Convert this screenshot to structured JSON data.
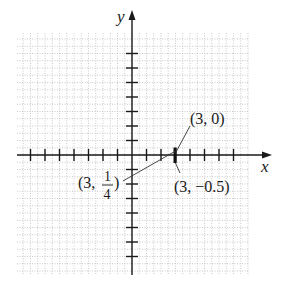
{
  "chart_data": {
    "type": "scatter",
    "title": "",
    "xlabel": "x",
    "ylabel": "y",
    "grid": true,
    "grid_style": "dotted",
    "xlim": [
      -7.5,
      8.5
    ],
    "ylim": [
      -8,
      8.5
    ],
    "x_ticks": [
      -7,
      -6,
      -5,
      -4,
      -3,
      -2,
      -1,
      1,
      2,
      3,
      4,
      5,
      6,
      7
    ],
    "y_ticks": [
      -7,
      -6,
      -5,
      -4,
      -3,
      -2,
      -1,
      1,
      2,
      3,
      4,
      5,
      6,
      7
    ],
    "tick_labels_shown": false,
    "highlighted_segment": {
      "x": 3,
      "y_from": -0.5,
      "y_to": 0.5,
      "description": "thick vertical mark at x = 3"
    },
    "annotations": [
      {
        "label": "(3, 0)",
        "point": [
          3,
          0
        ],
        "position": "upper-right"
      },
      {
        "label": "(3, 1/4)",
        "point": [
          3,
          0.25
        ],
        "position": "left-below"
      },
      {
        "label": "(3, -0.5)",
        "point": [
          3,
          -0.5
        ],
        "position": "lower-right"
      }
    ]
  },
  "labels": {
    "x_axis": "x",
    "y_axis": "y",
    "point_3_0": "(3, 0)",
    "point_3_quarter_prefix": "(3,",
    "point_3_quarter_num": "1",
    "point_3_quarter_den": "4",
    "point_3_quarter_suffix": ")",
    "point_3_neg_half": "(3, −0.5)"
  },
  "colors": {
    "axis": "#1a1a1a",
    "grid": "#bdbdbd",
    "background": "#ffffff"
  }
}
